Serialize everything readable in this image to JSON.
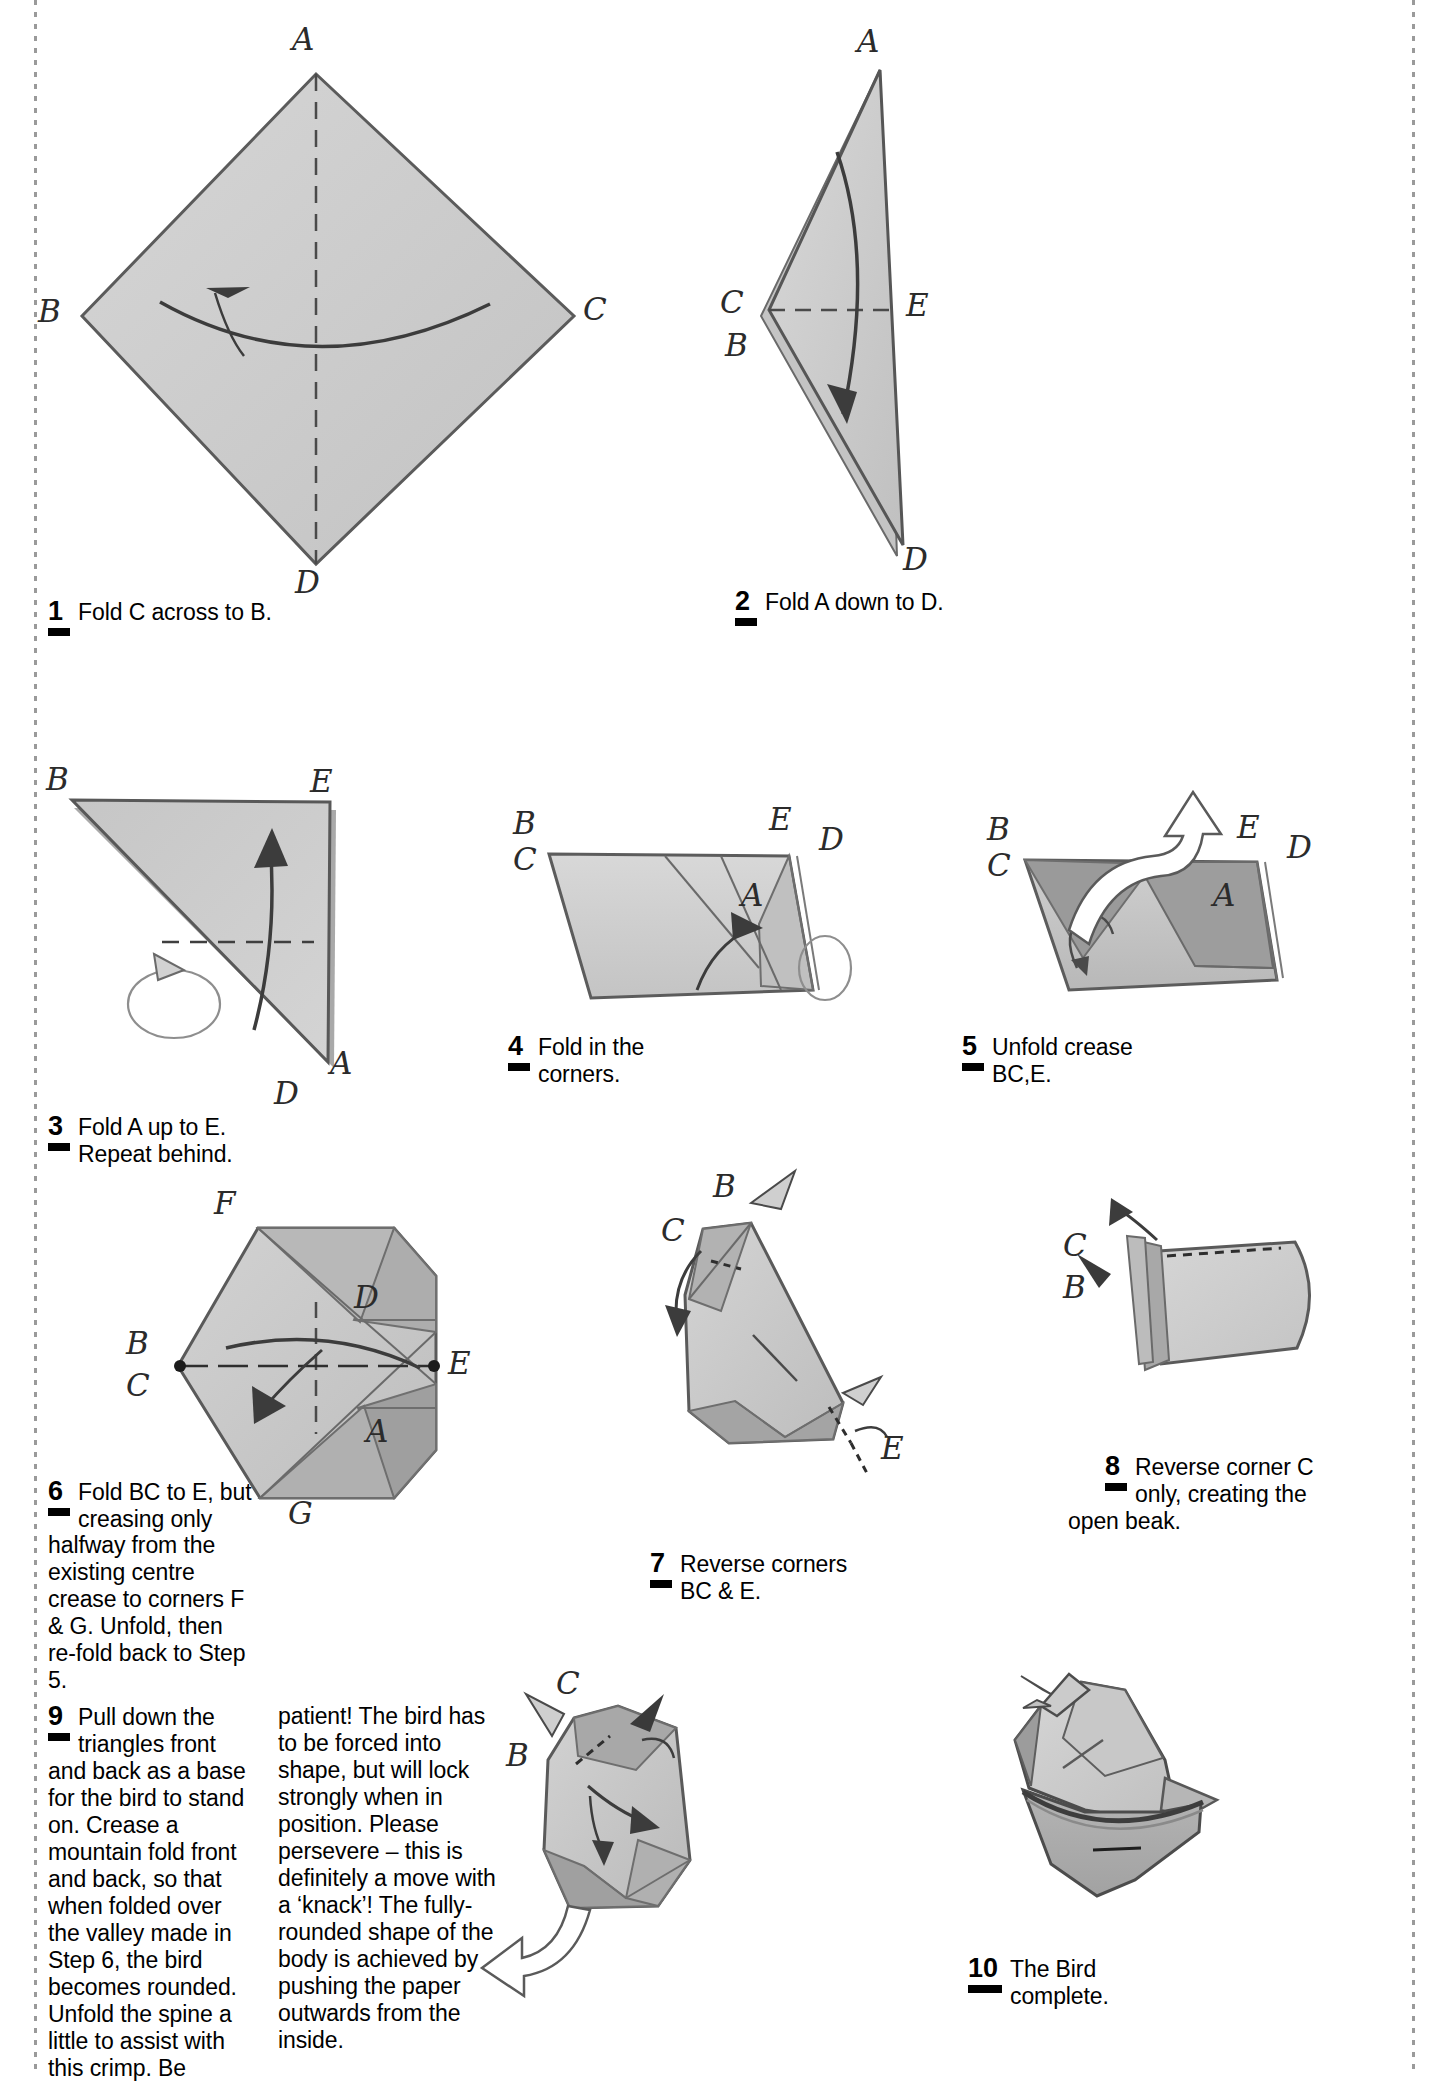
{
  "document": {
    "title": "The Bird",
    "type": "origami-folding-instructions",
    "paper_color": "#c9c9c9",
    "shade_color": "#9d9d9d",
    "ink_color": "#3a3a3a"
  },
  "steps": [
    {
      "number": "1",
      "text": "Fold C across to B.",
      "labels": [
        "A",
        "B",
        "C",
        "D"
      ]
    },
    {
      "number": "2",
      "text": "Fold A down to D.",
      "labels": [
        "A",
        "C",
        "B",
        "E",
        "D"
      ]
    },
    {
      "number": "3",
      "text": "Fold A up to E.\nRepeat behind.",
      "line1": "Fold A up to E.",
      "line2": "Repeat behind.",
      "labels": [
        "B",
        "E",
        "A",
        "D"
      ]
    },
    {
      "number": "4",
      "line1": "Fold in the",
      "line2": "corners.",
      "labels": [
        "B",
        "C",
        "E",
        "D",
        "A"
      ]
    },
    {
      "number": "5",
      "line1": "Unfold crease",
      "line2": "BC,E.",
      "labels": [
        "B",
        "C",
        "E",
        "D",
        "A"
      ]
    },
    {
      "number": "6",
      "line1": "Fold BC to E, but",
      "line2": "creasing only",
      "body": "halfway from the existing centre crease to corners F & G. Unfold, then re-fold back to Step 5.",
      "labels": [
        "F",
        "D",
        "B",
        "C",
        "E",
        "A",
        "G"
      ]
    },
    {
      "number": "7",
      "line1": "Reverse corners",
      "line2": "BC & E.",
      "labels": [
        "B",
        "C",
        "E"
      ]
    },
    {
      "number": "8",
      "line1": "Reverse corner C",
      "line2": "only, creating the",
      "body": "open beak.",
      "labels": [
        "C",
        "B"
      ]
    },
    {
      "number": "9",
      "line1": "Pull down the",
      "line2": "triangles front",
      "column1": "and back as a base for the bird to stand on. Crease a mountain fold front and back, so that when folded over the valley made in Step 6, the bird becomes rounded. Unfold the spine a little to assist with this crimp. Be",
      "column2": "patient! The bird has to be forced into shape, but will lock strongly when in position. Please persevere – this is definitely a move with a ‘knack’! The fully-rounded shape of the body is achieved by pushing the paper outwards from the inside.",
      "labels": [
        "C",
        "B"
      ]
    },
    {
      "number": "10",
      "line1": "The Bird",
      "line2": "complete.",
      "labels": []
    }
  ]
}
